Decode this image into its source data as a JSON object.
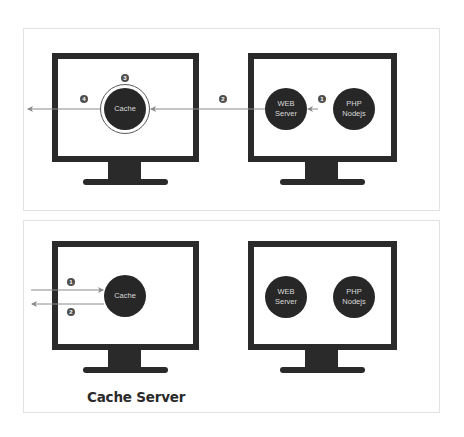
{
  "diagram": {
    "top_panel": {
      "left_monitor": {
        "node": {
          "label": "Cache",
          "highlighted": true
        }
      },
      "right_monitor": {
        "nodes": [
          {
            "label": "WEB\nServer"
          },
          {
            "label": "PHP\nNodejs"
          }
        ]
      },
      "steps": [
        {
          "number": "1",
          "description": "PHP/Nodejs to WEB Server"
        },
        {
          "number": "2",
          "description": "WEB Server to Cache"
        },
        {
          "number": "3",
          "description": "Cache stores response"
        },
        {
          "number": "4",
          "description": "Cache to client"
        }
      ]
    },
    "bottom_panel": {
      "left_monitor": {
        "node": {
          "label": "Cache"
        },
        "caption": "Cache Server"
      },
      "right_monitor": {
        "nodes": [
          {
            "label": "WEB\nServer"
          },
          {
            "label": "PHP\nNodejs"
          }
        ]
      },
      "steps": [
        {
          "number": "1",
          "description": "Request into Cache"
        },
        {
          "number": "2",
          "description": "Cache response out"
        }
      ]
    },
    "colors": {
      "monitor": "#2a2a2a",
      "node_fill": "#272727",
      "node_text": "#d8d8d8",
      "arrow": "#8a8a8a",
      "marker": "#4e4e4e",
      "panel_border": "#e2e2e2"
    }
  }
}
